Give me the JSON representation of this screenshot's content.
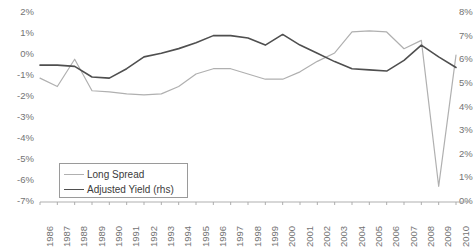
{
  "chart_data": {
    "type": "line",
    "title": "",
    "xlabel": "",
    "ylabel": "",
    "grid": false,
    "legend_position": "inside-bottom-left",
    "categories": [
      "1986",
      "1987",
      "1988",
      "1989",
      "1990",
      "1991",
      "1992",
      "1993",
      "1994",
      "1995",
      "1996",
      "1997",
      "1998",
      "1999",
      "2000",
      "2001",
      "2002",
      "2003",
      "2004",
      "2005",
      "2006",
      "2007",
      "2008",
      "2009",
      "2010"
    ],
    "left_axis": {
      "name": "Long Spread (lhs)",
      "ticks": [
        "2%",
        "1%",
        "0%",
        "-1%",
        "-2%",
        "-3%",
        "-4%",
        "-5%",
        "-6%",
        "-7%"
      ],
      "tick_values": [
        2,
        1,
        0,
        -1,
        -2,
        -3,
        -4,
        -5,
        -6,
        -7
      ],
      "ylim": [
        -7,
        2
      ]
    },
    "right_axis": {
      "name": "Adjusted Yield (rhs)",
      "ticks": [
        "8%",
        "7%",
        "6%",
        "5%",
        "4%",
        "3%",
        "2%",
        "1%",
        "0%"
      ],
      "tick_values": [
        8,
        7,
        6,
        5,
        4,
        3,
        2,
        1,
        0
      ],
      "ylim": [
        0,
        8
      ]
    },
    "series": [
      {
        "name": "Long Spread",
        "axis": "left",
        "color": "#b0b0b0",
        "width": 1.2,
        "values": [
          -1.15,
          -1.55,
          -0.25,
          -1.75,
          -1.8,
          -1.9,
          -1.95,
          -1.9,
          -1.55,
          -0.95,
          -0.7,
          -0.7,
          -0.95,
          -1.2,
          -1.2,
          -0.85,
          -0.35,
          0.05,
          1.05,
          1.1,
          1.05,
          0.25,
          0.65,
          -6.3,
          -0.05
        ]
      },
      {
        "name": "Adjusted Yield (rhs)",
        "axis": "right",
        "color": "#4f4f4f",
        "width": 1.6,
        "values": [
          5.75,
          5.75,
          5.7,
          5.25,
          5.2,
          5.6,
          6.1,
          6.25,
          6.45,
          6.7,
          7.0,
          7.0,
          6.9,
          6.6,
          7.05,
          6.6,
          6.25,
          5.9,
          5.6,
          5.55,
          5.5,
          5.95,
          6.6,
          6.1,
          5.65
        ]
      }
    ],
    "legend": [
      {
        "label": "Long Spread",
        "color": "#b0b0b0",
        "width": 1.2
      },
      {
        "label": "Adjusted Yield (rhs)",
        "color": "#4f4f4f",
        "width": 1.6
      }
    ]
  }
}
